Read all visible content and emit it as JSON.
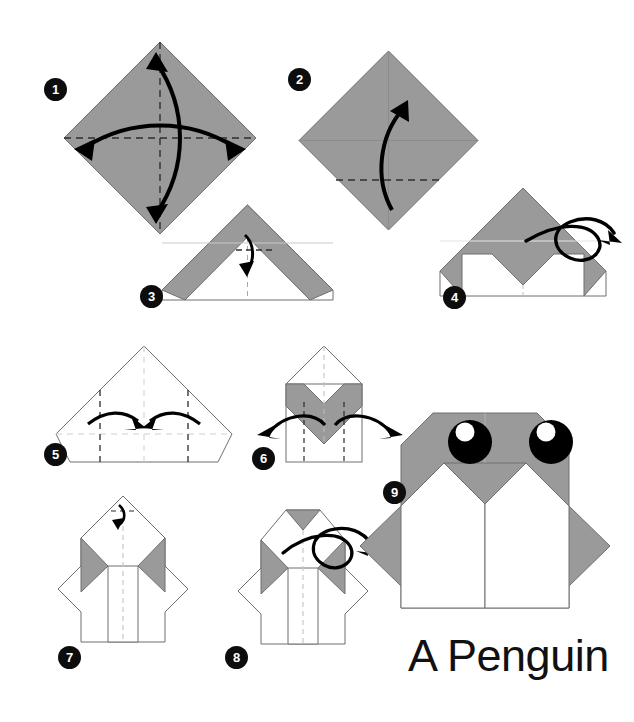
{
  "document": {
    "kind": "origami-instruction-diagram",
    "title": "A Penguin",
    "title_position": {
      "x": 408,
      "y": 630
    },
    "background_color": "#ffffff",
    "canvas": {
      "width": 634,
      "height": 722
    }
  },
  "palette": {
    "paper_colored": "#9a9a9a",
    "paper_white": "#ffffff",
    "outline": "#555555",
    "crease_solid": "#b8b8b8",
    "crease_dashed": "#3a3a3a",
    "crease_dashed_light": "#c9c9c9",
    "arrow": "#000000",
    "badge_fill": "#0d0d0d",
    "badge_text": "#ffffff",
    "eye_black": "#000000",
    "eye_highlight": "#ffffff",
    "title_text": "#111111"
  },
  "steps": [
    {
      "number": "1",
      "badge": {
        "x": 44,
        "y": 78
      },
      "caption": "Crease the square diagonally both ways and unfold.",
      "shape": "square-diamond",
      "fill": "paper_colored",
      "creases": [
        "vertical-dashed",
        "horizontal-dashed"
      ],
      "arrows": [
        "double-headed-vertical-curve",
        "double-headed-horizontal-curve"
      ]
    },
    {
      "number": "2",
      "badge": {
        "x": 288,
        "y": 68
      },
      "caption": "Fold the bottom corner up to the center.",
      "shape": "square-diamond",
      "fill": "paper_colored",
      "creases": [
        "horizontal-dashed-lower",
        "center-soft"
      ],
      "arrows": [
        "single-up-curve"
      ]
    },
    {
      "number": "3",
      "badge": {
        "x": 140,
        "y": 285
      },
      "caption": "Fold the small top flap point down.",
      "shape": "roof-triangle",
      "fill": "paper_colored",
      "creases": [
        "vertical-dashed",
        "short-horizontal-dashed"
      ],
      "arrows": [
        "small-down-curve"
      ]
    },
    {
      "number": "4",
      "badge": {
        "x": 443,
        "y": 286
      },
      "caption": "Turn the model over.",
      "shape": "roof-triangle-notched",
      "fill": "paper_colored",
      "creases": [
        "vertical-dashed-light"
      ],
      "arrows": [
        "flip-over-loop"
      ]
    },
    {
      "number": "5",
      "badge": {
        "x": 44,
        "y": 443
      },
      "caption": "Fold both sides in to the center line.",
      "shape": "white-pentagon",
      "fill": "paper_white",
      "creases": [
        "vertical-dashed-left",
        "vertical-dashed-center",
        "vertical-dashed-right",
        "horizontal-dashed-light"
      ],
      "arrows": [
        "inward-left-curve",
        "inward-right-curve"
      ]
    },
    {
      "number": "6",
      "badge": {
        "x": 252,
        "y": 447
      },
      "caption": "Fold the side flaps back out.",
      "shape": "chevron-body",
      "fill": "mixed",
      "creases": [
        "vertical-dashed-left",
        "vertical-dashed-center",
        "vertical-dashed-right"
      ],
      "arrows": [
        "outward-left-curve",
        "outward-right-curve"
      ]
    },
    {
      "number": "7",
      "badge": {
        "x": 58,
        "y": 646
      },
      "caption": "Fold the top point down a little.",
      "shape": "penguin-body-pointed",
      "fill": "mixed",
      "creases": [
        "vertical-dashed-center",
        "short-top-dashed"
      ],
      "arrows": [
        "tiny-down-curl"
      ]
    },
    {
      "number": "8",
      "badge": {
        "x": 225,
        "y": 646
      },
      "caption": "Turn the model over.",
      "shape": "penguin-body-flat-top",
      "fill": "mixed",
      "creases": [
        "vertical-dashed-center"
      ],
      "arrows": [
        "flip-over-loop"
      ]
    },
    {
      "number": "9",
      "badge": {
        "x": 383,
        "y": 481
      },
      "caption": "The finished penguin.",
      "shape": "penguin-final",
      "fill": "mixed",
      "features": [
        "left-eye",
        "right-eye",
        "white-belly",
        "beak-notch"
      ]
    }
  ],
  "final_figure": {
    "eyes": [
      {
        "name": "left-eye",
        "cx": 470,
        "cy": 442,
        "r": 22,
        "highlight": {
          "cx": 465,
          "cy": 432,
          "r": 9
        }
      },
      {
        "name": "right-eye",
        "cx": 551,
        "cy": 442,
        "r": 22,
        "highlight": {
          "cx": 546,
          "cy": 432,
          "r": 9
        }
      }
    ],
    "body_color": "#9a9a9a",
    "belly_color": "#ffffff"
  }
}
